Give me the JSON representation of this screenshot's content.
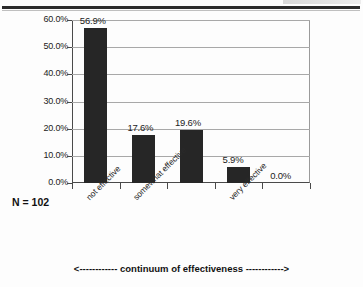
{
  "figure": {
    "n_annotation": "N = 102",
    "continuum_caption": "<------------ continuum of effectiveness ------------>"
  },
  "chart_data": {
    "type": "bar",
    "title": "",
    "subtitle": "",
    "xlabel": "continuum of effectiveness",
    "ylabel": "",
    "categories": [
      "not effective",
      "somewhat effective",
      "",
      "very effective",
      ""
    ],
    "values": [
      56.9,
      17.6,
      19.6,
      5.9,
      0.0
    ],
    "data_labels": [
      "56.9%",
      "17.6%",
      "19.6%",
      "5.9%",
      "0.0%"
    ],
    "ylim": [
      0,
      60
    ],
    "ytick_values": [
      0,
      10,
      20,
      30,
      40,
      50,
      60
    ],
    "ytick_labels": [
      "0.0%",
      "10.0%",
      "20.0%",
      "30.0%",
      "40.0%",
      "50.0%",
      "60.0%"
    ],
    "grid": true,
    "legend": "none",
    "bar_color": "#262626",
    "gridline_color": "#a8a8a8",
    "axis_color": "#4a4a4a",
    "sample_size": 102,
    "annotations": [
      "N = 102",
      "<------------ continuum of effectiveness ------------>"
    ]
  }
}
